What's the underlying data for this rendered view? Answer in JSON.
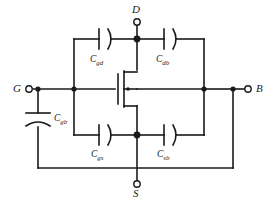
{
  "diagram": {
    "type": "circuit-schematic",
    "line_color": "#1a1a1a",
    "background": "#ffffff",
    "terminals": [
      {
        "id": "gate",
        "label": "G",
        "position": "left",
        "marker": "open-circle"
      },
      {
        "id": "drain",
        "label": "D",
        "position": "top",
        "marker": "open-circle"
      },
      {
        "id": "source",
        "label": "S",
        "position": "bottom",
        "marker": "open-circle"
      },
      {
        "id": "body",
        "label": "B",
        "position": "right",
        "marker": "open-circle"
      }
    ],
    "capacitors": [
      {
        "id": "cgd",
        "base": "C",
        "sub": "gd",
        "between": [
          "G",
          "D"
        ],
        "orientation": "horizontal",
        "location": "top-left"
      },
      {
        "id": "cdb",
        "base": "C",
        "sub": "db",
        "between": [
          "D",
          "B"
        ],
        "orientation": "horizontal",
        "location": "top-right"
      },
      {
        "id": "cgs",
        "base": "C",
        "sub": "gs",
        "between": [
          "G",
          "S"
        ],
        "orientation": "horizontal",
        "location": "bottom-left"
      },
      {
        "id": "csb",
        "base": "C",
        "sub": "sb",
        "between": [
          "S",
          "B"
        ],
        "orientation": "horizontal",
        "location": "bottom-right"
      },
      {
        "id": "cgb",
        "base": "C",
        "sub": "gb",
        "between": [
          "G",
          "B"
        ],
        "orientation": "vertical",
        "location": "left"
      }
    ],
    "device": {
      "id": "mosfet",
      "type": "mosfet-nmos",
      "terminals": [
        "gate",
        "drain",
        "source",
        "body"
      ]
    },
    "junctions": 6
  }
}
